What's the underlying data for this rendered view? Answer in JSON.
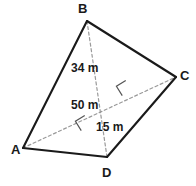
{
  "figure": {
    "type": "quadrilateral-with-diagonals",
    "canvas": {
      "width": 196,
      "height": 186
    },
    "colors": {
      "side_stroke": "#1a1a1a",
      "diagonal_stroke": "#9a9a9a",
      "right_angle_stroke": "#555555",
      "label_color": "#1a1a1a",
      "background": "#ffffff"
    },
    "vertices": [
      {
        "name": "B",
        "label": "B",
        "x": 87,
        "y": 21,
        "label_x": 78,
        "label_y": 2
      },
      {
        "name": "C",
        "label": "C",
        "x": 176,
        "y": 77,
        "label_x": 180,
        "label_y": 69
      },
      {
        "name": "D",
        "label": "D",
        "x": 107,
        "y": 157,
        "label_x": 102,
        "label_y": 166
      },
      {
        "name": "A",
        "label": "A",
        "x": 23,
        "y": 148,
        "label_x": 11,
        "label_y": 143
      }
    ],
    "sides": [
      {
        "name": "side-AB",
        "from": "A",
        "to": "B"
      },
      {
        "name": "side-BC",
        "from": "B",
        "to": "C"
      },
      {
        "name": "side-CD",
        "from": "C",
        "to": "D"
      },
      {
        "name": "side-DA",
        "from": "D",
        "to": "A"
      }
    ],
    "diagonals": [
      {
        "name": "diagonal-AC",
        "from": "A",
        "to": "C"
      },
      {
        "name": "diagonal-BD",
        "from": "B",
        "to": "D"
      }
    ],
    "measures": [
      {
        "name": "height-from-B",
        "text": "34 m",
        "x": 71,
        "y": 62
      },
      {
        "name": "diagonal-AC-length",
        "text": "50 m",
        "x": 71,
        "y": 99
      },
      {
        "name": "height-from-D",
        "text": "15 m",
        "x": 96,
        "y": 121
      }
    ],
    "right_angles": [
      {
        "name": "right-angle-upper",
        "cx": 124,
        "cy": 88,
        "size": 11,
        "rotation": -32
      },
      {
        "name": "right-angle-lower",
        "cx": 83,
        "cy": 123,
        "size": 11,
        "rotation": -32
      }
    ]
  }
}
